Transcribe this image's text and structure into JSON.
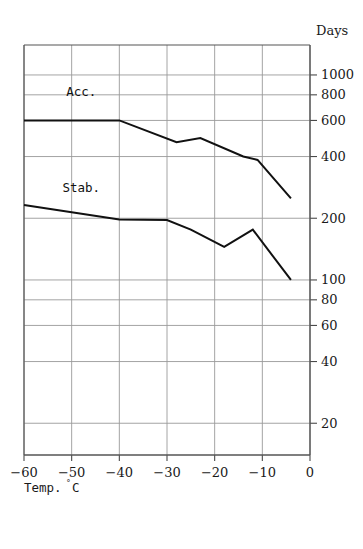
{
  "chart_data": {
    "type": "line",
    "title": "",
    "xlabel": "Temp.°C",
    "ylabel": "Days",
    "yscale": "log",
    "xscale": "linear",
    "xlim": [
      -60,
      0
    ],
    "ylim": [
      14,
      1400
    ],
    "grid": true,
    "legend_position": "inline-annotations",
    "x_ticks": [
      -60,
      -50,
      -40,
      -30,
      -20,
      -10,
      0
    ],
    "x_tick_labels": [
      "−60",
      "−50",
      "−40",
      "−30",
      "−20",
      "−10",
      "0"
    ],
    "y_ticks": [
      1000,
      800,
      600,
      400,
      200,
      100,
      80,
      60,
      40,
      20
    ],
    "y_tick_labels": [
      "1000",
      "800",
      "600",
      "400",
      "200",
      "100",
      "80",
      "60",
      "40",
      "20"
    ],
    "series": [
      {
        "name": "Acc.",
        "label": "Acc.",
        "color": "#111111",
        "annotation_x": -48,
        "annotation_y": 790,
        "x": [
          -60,
          -40,
          -28,
          -23,
          -14,
          -11,
          -4
        ],
        "y": [
          600,
          600,
          470,
          492,
          400,
          385,
          250
        ]
      },
      {
        "name": "Stab.",
        "label": "Stab.",
        "color": "#111111",
        "annotation_x": -48,
        "annotation_y": 270,
        "x": [
          -60,
          -40,
          -30,
          -25,
          -18,
          -12,
          -4
        ],
        "y": [
          232,
          197,
          196,
          176,
          145,
          176,
          100
        ]
      }
    ]
  },
  "axis": {
    "y_title": "Days",
    "x_title_main": "Temp.",
    "x_title_unit": "°",
    "x_title_unit_tail": "C"
  },
  "colors": {
    "axis": "#4a4a4a",
    "grid": "#9a9a9a",
    "frame": "#555555",
    "curve": "#111111",
    "text": "#1a1a1a"
  }
}
